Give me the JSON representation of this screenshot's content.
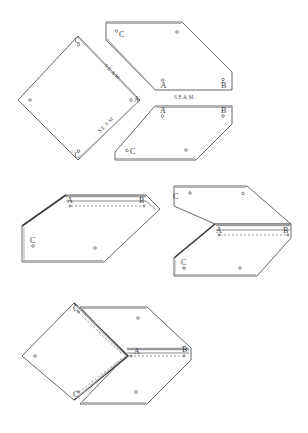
{
  "figure": {
    "background_color": "#ffffff",
    "line_color": "#55555a",
    "label_color": "#3a3a3f",
    "width": 308,
    "height": 433
  },
  "labels": {
    "A": "A",
    "B": "B",
    "C": "C",
    "seam": "SEAM"
  },
  "steps": [
    {
      "name": "flat-pattern",
      "caption": "",
      "pieces": [
        {
          "name": "diamond-panel",
          "shape": "diamond",
          "vertex_labels": [
            "C",
            "A",
            "C"
          ],
          "seam_labels": [
            "SEAM",
            "SEAM"
          ],
          "hole_count": 5
        },
        {
          "name": "upper-pentagon-panel",
          "shape": "pentagon",
          "vertex_labels": [
            "C",
            "A",
            "B"
          ],
          "seam_labels": [
            "SEAM"
          ],
          "hole_count": 5
        },
        {
          "name": "lower-pentagon-panel",
          "shape": "pentagon",
          "vertex_labels": [
            "A",
            "B",
            "C"
          ],
          "seam_labels": [],
          "hole_count": 5
        }
      ]
    },
    {
      "name": "partial-fold-left",
      "piece_labels": [
        "A",
        "B",
        "C"
      ],
      "hole_count": 4
    },
    {
      "name": "partial-fold-right",
      "piece_labels": [
        "C",
        "A",
        "B",
        "C"
      ],
      "hole_count": 5
    },
    {
      "name": "assembled-3d",
      "piece_labels": [
        "C",
        "A",
        "B",
        "C"
      ],
      "hole_count": 5
    }
  ],
  "annotations": {
    "seam_top_diagonal": "SEAM",
    "seam_bottom_diagonal": "SEAM",
    "seam_horizontal": "SEAM"
  }
}
